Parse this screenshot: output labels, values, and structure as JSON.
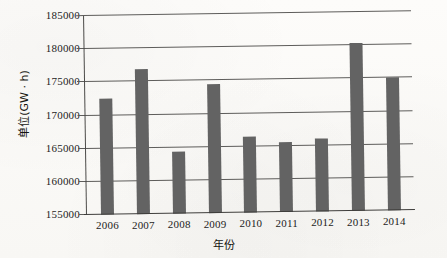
{
  "chart_data": {
    "type": "bar",
    "title": "",
    "xlabel": "年份",
    "ylabel": "单位(GW · h)",
    "categories": [
      "2006",
      "2007",
      "2008",
      "2009",
      "2010",
      "2011",
      "2012",
      "2013",
      "2014"
    ],
    "values": [
      172500,
      176800,
      164300,
      174400,
      166400,
      165500,
      166000,
      180400,
      175000
    ],
    "ylim": [
      155000,
      185000
    ],
    "yticks": [
      155000,
      160000,
      165000,
      170000,
      175000,
      180000,
      185000
    ],
    "ytick_labels": [
      "155000",
      "160000",
      "165000",
      "170000",
      "175000",
      "180000",
      "185000"
    ],
    "grid": true,
    "legend": false,
    "bar_color": "#636363",
    "background_color": "#fbfaf8"
  }
}
